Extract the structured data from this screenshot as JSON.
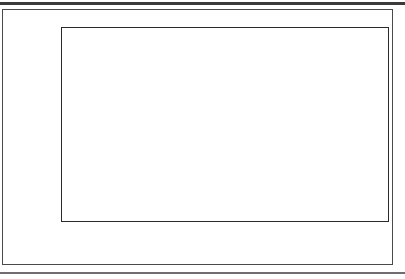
{
  "chart_data": {
    "type": "bar",
    "stacked": true,
    "title": "",
    "xlabel": "",
    "ylabel": "Percent of Population",
    "categories": [
      "1950",
      "1980",
      "2010",
      "2030",
      "2050"
    ],
    "series": [
      {
        "name": "65 and Over",
        "color": "#111111",
        "values": [
          7.8,
          10.2,
          11.2,
          18.2,
          16.1
        ]
      },
      {
        "name": "85 and Over",
        "color": "#ffffff",
        "values": [
          0.6,
          0.9,
          2.3,
          2.4,
          5.1
        ]
      }
    ],
    "totals": [
      8.4,
      11.1,
      13.5,
      20.6,
      21.2
    ],
    "ylim": [
      0,
      23
    ],
    "yticks": [
      0,
      2,
      4,
      6,
      8,
      10,
      12,
      14,
      16,
      18,
      20,
      22
    ],
    "grid": false,
    "legend_position": "bottom-left"
  },
  "legend": {
    "items": [
      {
        "label": "65 and Over",
        "swatch": "filled-square"
      },
      {
        "label": "85 and Over",
        "swatch": "hollow-square"
      }
    ]
  }
}
